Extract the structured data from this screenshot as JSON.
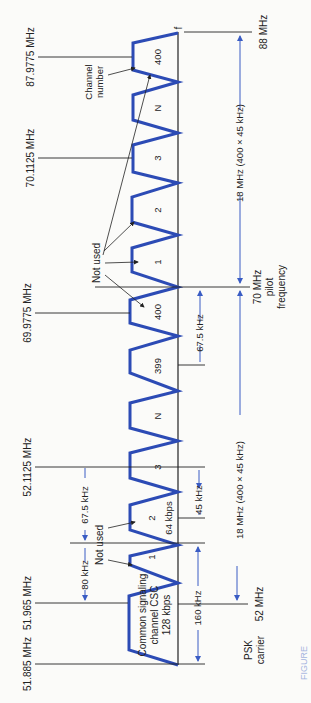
{
  "figure": {
    "caption_prefix": "FIGURE",
    "orientation": "rotated 90° (frequency increases upward)"
  },
  "axis": {
    "end_label": "f",
    "pilot_label_line1": "70 MHz",
    "pilot_label_line2": "pilot",
    "pilot_label_line3": "frequency",
    "psk_label_line1": "PSK",
    "psk_label_line2": "carrier",
    "low_edge": "52 MHz",
    "high_edge": "88 MHz"
  },
  "frequencies": {
    "f1": "51.885 MHz",
    "f2": "51.965 MHz",
    "f3": "52.1125 MHz",
    "f4": "69.9775 MHz",
    "f5": "70.1125 MHz",
    "f6": "87.9775 MHz"
  },
  "spans": {
    "lower_band": "18 MHz (400 × 45 kHz)",
    "upper_band": "18 MHz (400 × 45 kHz)",
    "csc_width": "160 kHz",
    "guard_80": "80 kHz",
    "offset_67_low": "67.5 kHz",
    "offset_67_pilot": "67.5 kHz",
    "channel_spacing": "45 kHz"
  },
  "channels": {
    "csc_line1": "Common signaling",
    "csc_line2": "channel CSC",
    "csc_line3": "128 kbps",
    "csc_number": "1",
    "ch2": "2",
    "ch2_rate": "64 kbps",
    "ch3": "3",
    "chN_low": "N",
    "ch399": "399",
    "ch400_low": "400",
    "ch1_up": "1",
    "ch2_up": "2",
    "ch3_up": "3",
    "chN_up": "N",
    "ch400_up": "400"
  },
  "annotations": {
    "not_used_low": "Not used",
    "not_used_pilot": "Not used",
    "channel_number_line1": "Channel",
    "channel_number_line2": "number"
  },
  "colors": {
    "trace": "#2c4bb5",
    "arrow": "#3a5cc4",
    "ink": "#222222"
  }
}
